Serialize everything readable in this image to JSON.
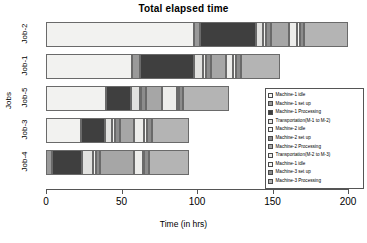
{
  "chart_data": {
    "type": "bar",
    "subtype": "stacked-horizontal-gantt",
    "title": "Total elapsed time",
    "xlabel": "Time (in hrs)",
    "ylabel": "Jobs",
    "xlim": [
      0,
      200
    ],
    "xticks": [
      0,
      50,
      100,
      150,
      200
    ],
    "xtick_labels": [
      "0",
      "50",
      "100",
      "150",
      "200"
    ],
    "grid": false,
    "legend_position": "right-inside",
    "categories": [
      "Job-2",
      "Job-1",
      "Job-5",
      "Job-3",
      "Job-4"
    ],
    "series": [
      {
        "name": "Machine-1 idle",
        "color": "#f2f2f0",
        "values": [
          98,
          57,
          40,
          23,
          0
        ]
      },
      {
        "name": "Machine-1 set up",
        "color": "#9a9a9a",
        "values": [
          4,
          5,
          0,
          0,
          4
        ]
      },
      {
        "name": "Machine-1 Processing",
        "color": "#3f3f3f",
        "values": [
          37,
          36,
          16,
          16,
          20
        ]
      },
      {
        "name": "Transportation(M-1 to M-2)",
        "color": "#e2e2e0",
        "values": [
          5,
          6,
          6,
          5,
          7
        ]
      },
      {
        "name": "Machine-2 idle",
        "color": "#f2f2f0",
        "values": [
          2,
          2,
          1,
          2,
          2
        ]
      },
      {
        "name": "Machine-2 set up",
        "color": "#8c8c8c",
        "values": [
          3,
          3,
          3,
          3,
          3
        ]
      },
      {
        "name": "Machine-2 Processing",
        "color": "#a6a6a6",
        "values": [
          12,
          10,
          11,
          9,
          22
        ]
      },
      {
        "name": "Transportation(M-2 to M-3)",
        "color": "#ededeb",
        "values": [
          5,
          5,
          10,
          7,
          6
        ]
      },
      {
        "name": "Machine-1 idle",
        "color": "#f7f7f5",
        "values": [
          2,
          2,
          1,
          2,
          1
        ]
      },
      {
        "name": "Machine-3 set up",
        "color": "#8c8c8c",
        "values": [
          3,
          3,
          3,
          3,
          3
        ]
      },
      {
        "name": "Machine-3 Processing",
        "color": "#b4b4b4",
        "values": [
          29,
          26,
          30,
          25,
          27
        ]
      }
    ],
    "totals": [
      200,
      155,
      121,
      95,
      95
    ]
  },
  "legend": {
    "items": [
      {
        "label": "Machine-1 idle",
        "color": "#f7f7f5"
      },
      {
        "label": "Machine-1 set up",
        "color": "#9a9a9a"
      },
      {
        "label": "Machine-1 Processing",
        "color": "#3f3f3f"
      },
      {
        "label": "Transportation(M-1 to M-2)",
        "color": "#e8e8e6"
      },
      {
        "label": "Machine-2 idle",
        "color": "#f7f7f5"
      },
      {
        "label": "Machine-2 set up",
        "color": "#8c8c8c"
      },
      {
        "label": "Machine-2 Processing",
        "color": "#a6a6a6"
      },
      {
        "label": "Transportation(M-2 to M-3)",
        "color": "#ededeb"
      },
      {
        "label": "Machine-1 idle",
        "color": "#f7f7f5"
      },
      {
        "label": "Machine-3 set up",
        "color": "#8c8c8c"
      },
      {
        "label": "Machine-3 Processing",
        "color": "#b4b4b4"
      }
    ]
  }
}
